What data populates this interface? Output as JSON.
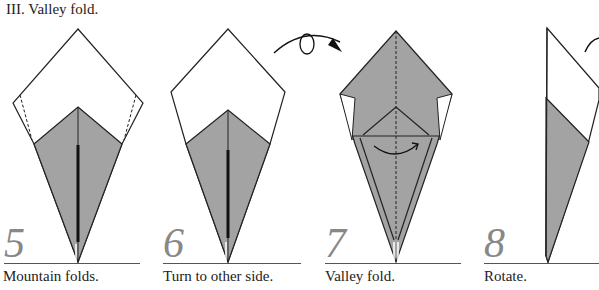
{
  "section": {
    "title": "III. Valley fold."
  },
  "colors": {
    "paper_white": "#ffffff",
    "paper_colored": "#a3a3a3",
    "line": "#222222",
    "step_number": "#888888"
  },
  "steps": [
    {
      "number": "5",
      "caption": "Mountain folds."
    },
    {
      "number": "6",
      "caption": "Turn to other side."
    },
    {
      "number": "7",
      "caption": "Valley fold."
    },
    {
      "number": "8",
      "caption": "Rotate."
    }
  ],
  "symbols": {
    "turn_over": "turn-over-arrow",
    "valley_fold_arrow": "curved-arrow"
  }
}
